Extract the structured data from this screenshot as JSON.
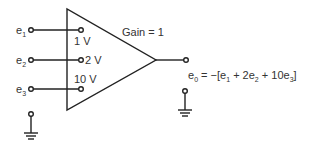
{
  "diagram": {
    "type": "summing amplifier",
    "gain_label": "Gain = 1",
    "inputs": [
      {
        "name": "e",
        "sub": "1",
        "weight": "1 V"
      },
      {
        "name": "e",
        "sub": "2",
        "weight": "2 V"
      },
      {
        "name": "e",
        "sub": "3",
        "weight": "10 V"
      }
    ],
    "output": {
      "lhs": "e",
      "lhs_sub": "0",
      "eq_prefix": " = −[e",
      "t1_sub": "1",
      "t2": " + 2e",
      "t2_sub": "2",
      "t3": " + 10e",
      "t3_sub": "3",
      "suffix": "]"
    },
    "colors": {
      "stroke": "#222222",
      "text": "#333333"
    }
  }
}
